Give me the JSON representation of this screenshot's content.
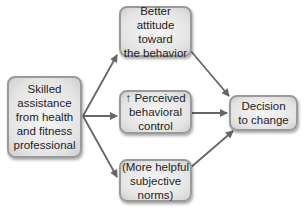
{
  "diagram": {
    "nodes": [
      {
        "id": "source",
        "label": "Skilled\nassistance\nfrom health\nand fitness\nprofessional"
      },
      {
        "id": "attitude",
        "label": "Better attitude\ntoward\nthe behavior"
      },
      {
        "id": "control",
        "label": "↑ Perceived\nbehavioral\ncontrol"
      },
      {
        "id": "norms",
        "label": "(More helpful\nsubjective\nnorms)"
      },
      {
        "id": "decision",
        "label": "Decision\nto change"
      }
    ],
    "edges": [
      {
        "from": "source",
        "to": "attitude"
      },
      {
        "from": "source",
        "to": "control"
      },
      {
        "from": "source",
        "to": "norms"
      },
      {
        "from": "attitude",
        "to": "decision"
      },
      {
        "from": "control",
        "to": "decision"
      },
      {
        "from": "norms",
        "to": "decision"
      }
    ],
    "colors": {
      "box_border": "#9a9a9a",
      "box_fill": "#e4e4e4",
      "arrow": "#666666",
      "text": "#222222"
    }
  }
}
